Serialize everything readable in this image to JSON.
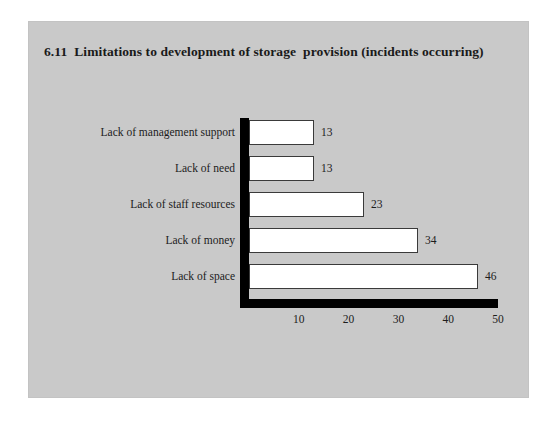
{
  "chart_data": {
    "type": "bar",
    "orientation": "horizontal",
    "title": "6.11  Limitations to development of storage  provision (incidents occurring)",
    "xlabel": "",
    "ylabel": "",
    "xlim": [
      0,
      50
    ],
    "grid": false,
    "legend": null,
    "categories": [
      "Lack of management support",
      "Lack of need",
      "Lack of staff resources",
      "Lack of money",
      "Lack of space"
    ],
    "values": [
      13,
      13,
      23,
      34,
      46
    ],
    "value_labels": [
      "13",
      "13",
      "23",
      "34",
      "46"
    ],
    "x_ticks": [
      10,
      20,
      30,
      40,
      50
    ],
    "x_tick_labels": [
      "10",
      "20",
      "30",
      "40",
      "50"
    ]
  },
  "style": {
    "panel_background": "#c9c9c9",
    "page_background": "#ffffff",
    "bar_fill": "#ffffff",
    "bar_border": "#3a3a3a",
    "axis_color": "#000000",
    "text_color": "#1c1c1c"
  }
}
